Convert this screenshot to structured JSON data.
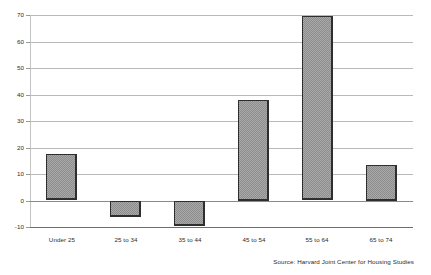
{
  "chart_data": {
    "type": "bar",
    "title": "",
    "subtitle": "",
    "xlabel": "",
    "ylabel": "",
    "categories": [
      "Under 25",
      "25 to 34",
      "35 to 44",
      "45 to 54",
      "55 to 64",
      "65 to 74"
    ],
    "values": [
      17.5,
      -6,
      -9.5,
      38,
      69.5,
      13.5
    ],
    "ylim": [
      -10,
      70
    ],
    "yticks": [
      -10,
      0,
      10,
      20,
      30,
      40,
      50,
      60,
      70
    ],
    "ytick_labels": [
      "-10",
      "0",
      "10",
      "20",
      "30",
      "40",
      "50",
      "60",
      "70"
    ],
    "grid": true,
    "legend": false,
    "legend_position": "none",
    "bar_fill": "#a8a8a8",
    "bar_pattern": "checkerboard-hatch",
    "bar_border": "#2e2e2e",
    "gridline_color": "#b9b9b9",
    "annotations": [
      "Source: Harvard Joint Center for Housing Studies"
    ]
  },
  "footer": {
    "source_note": "Source: Harvard Joint Center for Housing Studies"
  }
}
